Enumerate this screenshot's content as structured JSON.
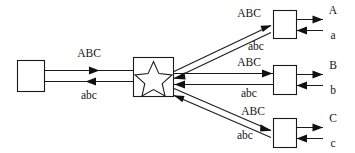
{
  "diagram": {
    "canvas": {
      "width": 355,
      "height": 153,
      "background": "#ffffff"
    },
    "colors": {
      "stroke": "#1a1a1a",
      "fill": "#ffffff",
      "text": "#141414"
    },
    "nodes": [
      {
        "id": "left-terminal",
        "shape": "rectangle",
        "label": "",
        "x": 17,
        "y": 60,
        "w": 28,
        "h": 32
      },
      {
        "id": "central-hub",
        "shape": "rectangle-with-star",
        "label": "",
        "x": 133,
        "y": 57,
        "w": 41,
        "h": 40
      },
      {
        "id": "branch-a",
        "shape": "rectangle",
        "label": "",
        "x": 273,
        "y": 10,
        "w": 24,
        "h": 29
      },
      {
        "id": "branch-b",
        "shape": "rectangle",
        "label": "",
        "x": 273,
        "y": 65,
        "w": 24,
        "h": 30
      },
      {
        "id": "branch-c",
        "shape": "rectangle",
        "label": "",
        "x": 273,
        "y": 118,
        "w": 24,
        "h": 30
      }
    ],
    "edges": [
      {
        "id": "left-outbound",
        "from": "left-terminal",
        "to": "central-hub",
        "direction": "right",
        "label": "ABC"
      },
      {
        "id": "left-inbound",
        "from": "central-hub",
        "to": "left-terminal",
        "direction": "left",
        "label": "abc"
      },
      {
        "id": "hub-to-a",
        "from": "central-hub",
        "to": "branch-a",
        "direction": "up-right",
        "label": "ABC"
      },
      {
        "id": "a-to-hub",
        "from": "branch-a",
        "to": "central-hub",
        "direction": "down-left",
        "label": "abc"
      },
      {
        "id": "hub-to-b",
        "from": "central-hub",
        "to": "branch-b",
        "direction": "right",
        "label": "ABC"
      },
      {
        "id": "b-to-hub",
        "from": "branch-b",
        "to": "central-hub",
        "direction": "left",
        "label": "abc"
      },
      {
        "id": "hub-to-c",
        "from": "central-hub",
        "to": "branch-c",
        "direction": "down-right",
        "label": "ABC"
      },
      {
        "id": "c-to-hub",
        "from": "branch-c",
        "to": "central-hub",
        "direction": "up-left",
        "label": "abc"
      }
    ],
    "terminals": [
      {
        "id": "terminal-a-out",
        "node": "branch-a",
        "direction": "right",
        "label": "A"
      },
      {
        "id": "terminal-a-in",
        "node": "branch-a",
        "direction": "left",
        "label": "a"
      },
      {
        "id": "terminal-b-out",
        "node": "branch-b",
        "direction": "right",
        "label": "B"
      },
      {
        "id": "terminal-b-in",
        "node": "branch-b",
        "direction": "left",
        "label": "b"
      },
      {
        "id": "terminal-c-out",
        "node": "branch-c",
        "direction": "right",
        "label": "C"
      },
      {
        "id": "terminal-c-in",
        "node": "branch-c",
        "direction": "left",
        "label": "c"
      }
    ],
    "labels": {
      "left_upper": "ABC",
      "left_lower": "abc",
      "top_upper": "ABC",
      "top_lower": "abc",
      "mid_upper": "ABC",
      "mid_lower": "abc",
      "bot_upper": "ABC",
      "bot_lower": "abc",
      "out_a": "A",
      "in_a": "a",
      "out_b": "B",
      "in_b": "b",
      "out_c": "C",
      "in_c": "c"
    }
  }
}
